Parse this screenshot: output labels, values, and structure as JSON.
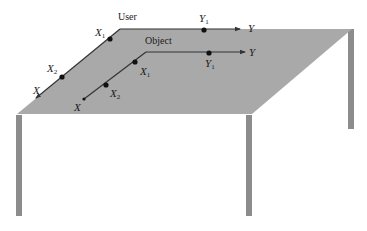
{
  "figure": {
    "colors": {
      "background": "#ffffff",
      "tabletop": "#a9a9a9",
      "legs": "#8c8c8c",
      "axis_line": "#333333",
      "point": "#111111"
    }
  },
  "frames": {
    "user": {
      "label": "User",
      "x_axis": {
        "label": "X",
        "points": [
          {
            "label": "X",
            "sub": "1"
          },
          {
            "label": "X",
            "sub": "2"
          }
        ]
      },
      "y_axis": {
        "label": "Y",
        "points": [
          {
            "label": "Y",
            "sub": "1"
          }
        ]
      }
    },
    "object": {
      "label": "Object",
      "x_axis": {
        "label": "X",
        "points": [
          {
            "label": "X",
            "sub": "1"
          },
          {
            "label": "X",
            "sub": "2"
          }
        ]
      },
      "y_axis": {
        "label": "Y",
        "points": [
          {
            "label": "Y",
            "sub": "1"
          }
        ]
      }
    }
  }
}
